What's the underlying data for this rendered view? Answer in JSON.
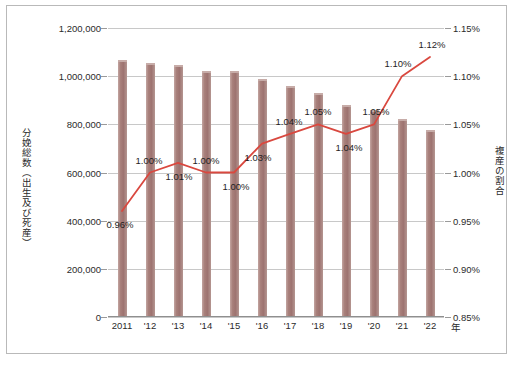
{
  "chart_data": {
    "type": "bar",
    "title": "",
    "subtitle": "",
    "xlabel": "年",
    "ylabel": "分娩総数（出生及び死産）",
    "y2label": "複産の割合",
    "categories": [
      "2011",
      "'12",
      "'13",
      "'14",
      "'15",
      "'16",
      "'17",
      "'18",
      "'19",
      "'20",
      "'21",
      "'22"
    ],
    "ylim": [
      0,
      1200000
    ],
    "yticks": [
      0,
      200000,
      400000,
      600000,
      800000,
      1000000,
      1200000
    ],
    "ytick_labels": [
      "0",
      "200,000",
      "400,000",
      "600,000",
      "800,000",
      "1,000,000",
      "1,200,000"
    ],
    "y2lim": [
      0.85,
      1.15
    ],
    "y2ticks": [
      0.85,
      0.9,
      0.95,
      1.0,
      1.05,
      1.1,
      1.15
    ],
    "y2tick_labels": [
      "0.85%",
      "0.90%",
      "0.95%",
      "1.00%",
      "1.05%",
      "1.10%",
      "1.15%"
    ],
    "grid": true,
    "legend": "none",
    "series": [
      {
        "name": "分娩総数（出生及び死産）",
        "type": "bar",
        "axis": "left",
        "color": "#a8807b",
        "values": [
          1068000,
          1053000,
          1046000,
          1022000,
          1021000,
          988000,
          958000,
          931000,
          880000,
          861000,
          821000,
          776000
        ]
      },
      {
        "name": "複産の割合",
        "type": "line",
        "axis": "right",
        "color": "#d9483f",
        "values": [
          0.96,
          1.0,
          1.01,
          1.0,
          1.0,
          1.03,
          1.04,
          1.05,
          1.04,
          1.05,
          1.1,
          1.12
        ],
        "data_labels": [
          "0.96%",
          "1.00%",
          "1.01%",
          "1.00%",
          "1.00%",
          "1.03%",
          "1.04%",
          "1.05%",
          "1.04%",
          "1.05%",
          "1.10%",
          "1.12%"
        ]
      }
    ]
  },
  "colors": {
    "bar": "#a8807b",
    "line": "#d9483f",
    "grid": "#c8c8c8",
    "axis": "#8f8f8f",
    "frame": "#b9b9b9",
    "text": "#2b2b2b"
  }
}
